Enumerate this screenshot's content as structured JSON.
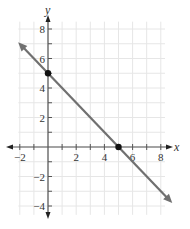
{
  "chart_data": {
    "type": "line",
    "title": "",
    "xlabel": "x",
    "ylabel": "y",
    "xlim": [
      -2,
      8
    ],
    "ylim": [
      -4,
      8
    ],
    "grid": true,
    "x_ticks": [
      -2,
      2,
      4,
      6,
      8
    ],
    "y_ticks": [
      8,
      6,
      4,
      2,
      -2,
      -4
    ],
    "x_tick_labels": [
      "−2",
      "2",
      "4",
      "6",
      "8"
    ],
    "y_tick_labels": [
      "8",
      "6",
      "4",
      "2",
      "−2",
      "−4"
    ],
    "series": [
      {
        "name": "line",
        "equation": "y = -x + 5",
        "x": [
          -1.9,
          8.6
        ],
        "y": [
          6.9,
          -3.6
        ],
        "arrows_both_ends": true
      }
    ],
    "points": [
      {
        "x": 0,
        "y": 5,
        "label": "y-intercept"
      },
      {
        "x": 5,
        "y": 0,
        "label": "x-intercept"
      }
    ]
  },
  "colors": {
    "line": "#707070",
    "axis": "#555555",
    "grid": "#e6e6e6",
    "point": "#111111",
    "text": "#333333"
  }
}
